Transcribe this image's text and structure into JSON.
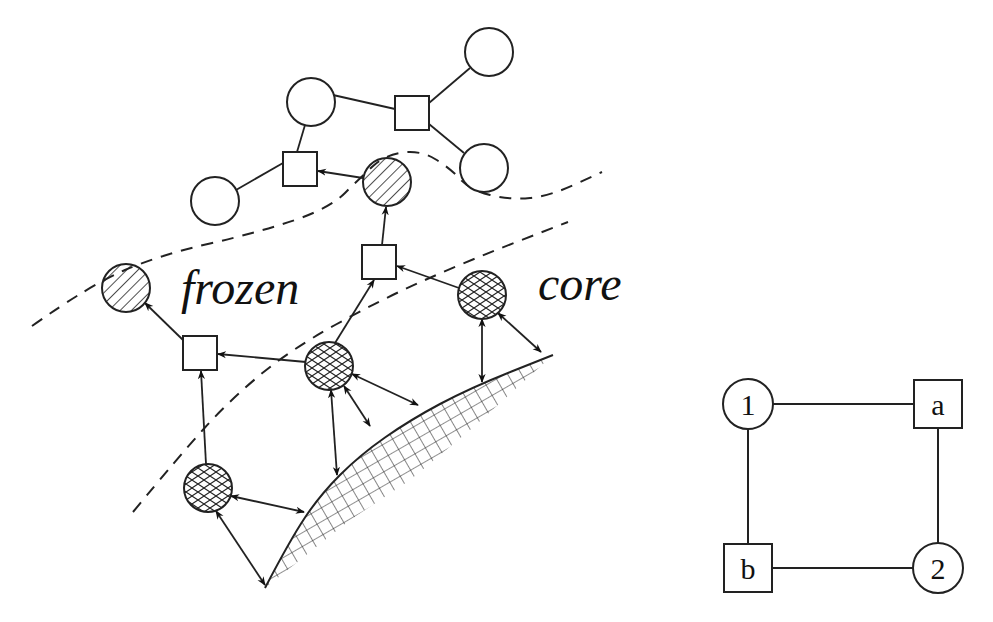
{
  "figure": {
    "background": "#ffffff",
    "stroke_color": "#222222",
    "left_diagram": {
      "region_labels": [
        {
          "id": "frozen",
          "text": "frozen",
          "x": 181,
          "y": 304
        },
        {
          "id": "core",
          "text": "core",
          "x": 538,
          "y": 300
        }
      ],
      "boundaries": [
        {
          "id": "upper-dashed-boundary",
          "points": [
            [
              32,
              326
            ],
            [
              90,
              285
            ],
            [
              160,
              255
            ],
            [
              260,
              232
            ],
            [
              330,
              208
            ],
            [
              360,
              178
            ],
            [
              385,
              155
            ],
            [
              420,
              150
            ],
            [
              450,
              168
            ],
            [
              470,
              190
            ],
            [
              510,
              200
            ],
            [
              550,
              196
            ],
            [
              602,
              172
            ]
          ]
        },
        {
          "id": "lower-dashed-boundary",
          "points": [
            [
              133,
              512
            ],
            [
              180,
              455
            ],
            [
              230,
              400
            ],
            [
              290,
              350
            ],
            [
              380,
              300
            ],
            [
              470,
              260
            ],
            [
              568,
              222
            ]
          ]
        }
      ],
      "surface": {
        "id": "core-surface",
        "curve": [
          [
            265,
            588
          ],
          [
            290,
            540
          ],
          [
            320,
            495
          ],
          [
            360,
            455
          ],
          [
            410,
            420
          ],
          [
            470,
            388
          ],
          [
            553,
            355
          ]
        ],
        "thickness_end": [
          [
            265,
            588
          ],
          [
            300,
            560
          ],
          [
            350,
            520
          ],
          [
            410,
            480
          ],
          [
            470,
            430
          ],
          [
            520,
            385
          ],
          [
            553,
            355
          ]
        ]
      },
      "nodes": [
        {
          "id": "n-top-circle",
          "shape": "circle",
          "fill": "empty",
          "cx": 311,
          "cy": 102,
          "r": 24
        },
        {
          "id": "n-top-right-circle",
          "shape": "circle",
          "fill": "empty",
          "cx": 489,
          "cy": 52,
          "r": 24
        },
        {
          "id": "n-right-circle",
          "shape": "circle",
          "fill": "empty",
          "cx": 484,
          "cy": 168,
          "r": 24
        },
        {
          "id": "n-left-circle",
          "shape": "circle",
          "fill": "empty",
          "cx": 215,
          "cy": 201,
          "r": 24
        },
        {
          "id": "n-square-top-left",
          "shape": "square",
          "fill": "empty",
          "cx": 300,
          "cy": 169,
          "size": 34
        },
        {
          "id": "n-square-top-right",
          "shape": "square",
          "fill": "empty",
          "cx": 412,
          "cy": 113,
          "size": 34
        },
        {
          "id": "n-hatched-circle-top",
          "shape": "circle",
          "fill": "hatched",
          "cx": 387,
          "cy": 182,
          "r": 24
        },
        {
          "id": "n-hatched-circle-left",
          "shape": "circle",
          "fill": "hatched",
          "cx": 126,
          "cy": 288,
          "r": 24
        },
        {
          "id": "n-square-middle",
          "shape": "square",
          "fill": "empty",
          "cx": 379,
          "cy": 262,
          "size": 34
        },
        {
          "id": "n-square-lower-left",
          "shape": "square",
          "fill": "empty",
          "cx": 200,
          "cy": 353,
          "size": 34
        },
        {
          "id": "n-cross-circle-right",
          "shape": "circle",
          "fill": "crosshatched",
          "cx": 482,
          "cy": 295,
          "r": 24
        },
        {
          "id": "n-cross-circle-middle",
          "shape": "circle",
          "fill": "crosshatched",
          "cx": 329,
          "cy": 366,
          "r": 24
        },
        {
          "id": "n-cross-circle-bottom",
          "shape": "circle",
          "fill": "crosshatched",
          "cx": 208,
          "cy": 488,
          "r": 24
        }
      ],
      "edges": [
        {
          "from": [
            333,
            95
          ],
          "to": [
            395,
            109
          ],
          "type": "line"
        },
        {
          "from": [
            429,
            103
          ],
          "to": [
            470,
            68
          ],
          "type": "line"
        },
        {
          "from": [
            429,
            124
          ],
          "to": [
            464,
            153
          ],
          "type": "line"
        },
        {
          "from": [
            305,
            125
          ],
          "to": [
            297,
            152
          ],
          "type": "line"
        },
        {
          "from": [
            236,
            190
          ],
          "to": [
            283,
            163
          ],
          "type": "line"
        },
        {
          "from": [
            363,
            178
          ],
          "to": [
            318,
            171
          ],
          "type": "arrow"
        },
        {
          "from": [
            382,
            245
          ],
          "to": [
            386,
            207
          ],
          "type": "arrow"
        },
        {
          "from": [
            459,
            288
          ],
          "to": [
            397,
            266
          ],
          "type": "arrow"
        },
        {
          "from": [
            183,
            340
          ],
          "to": [
            145,
            303
          ],
          "type": "arrow"
        },
        {
          "from": [
            306,
            362
          ],
          "to": [
            218,
            354
          ],
          "type": "arrow"
        },
        {
          "from": [
            335,
            343
          ],
          "to": [
            374,
            280
          ],
          "type": "arrow"
        },
        {
          "from": [
            206,
            464
          ],
          "to": [
            201,
            371
          ],
          "type": "arrow"
        },
        {
          "from": [
            482,
            319
          ],
          "to": [
            482,
            382
          ],
          "type": "double-arrow"
        },
        {
          "from": [
            498,
            313
          ],
          "to": [
            541,
            352
          ],
          "type": "double-arrow"
        },
        {
          "from": [
            352,
            374
          ],
          "to": [
            418,
            405
          ],
          "type": "double-arrow"
        },
        {
          "from": [
            344,
            386
          ],
          "to": [
            370,
            426
          ],
          "type": "double-arrow"
        },
        {
          "from": [
            331,
            390
          ],
          "to": [
            337,
            475
          ],
          "type": "double-arrow"
        },
        {
          "from": [
            231,
            496
          ],
          "to": [
            304,
            512
          ],
          "type": "double-arrow"
        },
        {
          "from": [
            216,
            511
          ],
          "to": [
            265,
            585
          ],
          "type": "double-arrow"
        }
      ]
    },
    "right_diagram": {
      "nodes": [
        {
          "id": "node-1",
          "shape": "circle",
          "label": "1",
          "cx": 748,
          "cy": 404,
          "r": 25
        },
        {
          "id": "node-a",
          "shape": "square",
          "label": "a",
          "cx": 938,
          "cy": 404,
          "size": 48
        },
        {
          "id": "node-b",
          "shape": "square",
          "label": "b",
          "cx": 748,
          "cy": 568,
          "size": 48
        },
        {
          "id": "node-2",
          "shape": "circle",
          "label": "2",
          "cx": 938,
          "cy": 568,
          "r": 25
        }
      ],
      "edges": [
        {
          "from": "1",
          "to": "a",
          "x1": 773,
          "y1": 404,
          "x2": 914,
          "y2": 404
        },
        {
          "from": "a",
          "to": "2",
          "x1": 938,
          "y1": 428,
          "x2": 938,
          "y2": 543
        },
        {
          "from": "1",
          "to": "b",
          "x1": 748,
          "y1": 429,
          "x2": 748,
          "y2": 544
        },
        {
          "from": "b",
          "to": "2",
          "x1": 772,
          "y1": 568,
          "x2": 913,
          "y2": 568
        }
      ]
    }
  }
}
